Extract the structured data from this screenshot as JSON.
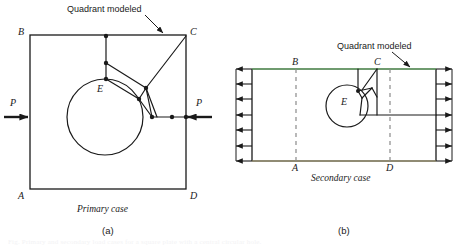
{
  "figure": {
    "background": "#ffffff",
    "line_color": "#1a1a1a",
    "green_edge_color": "#3f7a3f",
    "olive_edge_color": "#6b6446",
    "dashed_color": "#8a8a8a"
  },
  "panel_a": {
    "id": "(a)",
    "caption": "Primary case",
    "note": "Quadrant modeled",
    "vertices": {
      "top_left": "B",
      "top_right": "C",
      "bottom_left": "A",
      "bottom_right": "D",
      "hole": "E"
    },
    "load_left": "P",
    "load_right": "P",
    "geometry": {
      "square": {
        "x": 30,
        "y": 35,
        "w": 156,
        "h": 154
      },
      "circle": {
        "cx": 105,
        "cy": 117,
        "r": 38
      },
      "load_axis_y": 117,
      "mesh_nodes": [
        [
          106,
          36
        ],
        [
          106,
          63
        ],
        [
          106,
          79
        ],
        [
          146,
          88
        ],
        [
          139,
          99
        ],
        [
          152,
          117
        ],
        [
          172,
          117
        ],
        [
          186,
          117
        ],
        [
          186,
          36
        ]
      ]
    }
  },
  "panel_b": {
    "id": "(b)",
    "caption": "Secondary case",
    "note": "Quadrant modeled",
    "vertices": {
      "top_left": "B",
      "top_right": "C",
      "bottom_left": "A",
      "bottom_right": "D",
      "hole": "E"
    },
    "geometry": {
      "rect": {
        "x": 252,
        "y": 69,
        "w": 184,
        "h": 92
      },
      "circle": {
        "cx": 347,
        "cy": 106,
        "r": 21
      },
      "arrow_rows": 7,
      "symmetry_lines_x": [
        296,
        390
      ],
      "mesh_nodes": [
        [
          358,
          91
        ],
        [
          358,
          78
        ],
        [
          377,
          78
        ],
        [
          377,
          115
        ],
        [
          360,
          115
        ]
      ]
    }
  },
  "footer": {
    "text": "Fig.  Primary and secondary load cases for a square plate with a central circular hole."
  }
}
